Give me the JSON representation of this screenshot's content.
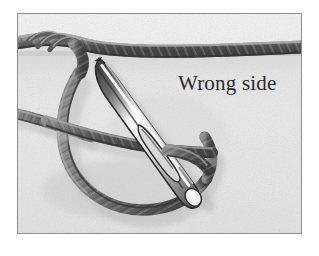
{
  "figure": {
    "kind": "instructional-illustration",
    "caption": "Wrong side",
    "frame": {
      "border_color": "#8e8e8e",
      "page_background": "#ffffff"
    },
    "palette": {
      "fabric_upper": "#f1f1f1",
      "fabric_lower": "#e6e6e6",
      "fabric_shadow": "#d2d2d2",
      "cord_dark": "#454545",
      "cord_mid": "#6d6d6d",
      "cord_light": "#9a9a9a",
      "needle_dark": "#3a3a3a",
      "needle_body": "#cfcfcf",
      "needle_highlight": "#ffffff",
      "caption_color": "#2a2a2a"
    },
    "elements": [
      {
        "name": "horizontal-cord",
        "label": "yarn running across the top of the fabric"
      },
      {
        "name": "cord-loop",
        "label": "large loop of yarn hanging below"
      },
      {
        "name": "left-cord-tail",
        "label": "yarn tail entering from the left edge"
      },
      {
        "name": "sewing-needle",
        "label": "tapestry needle angled from upper-left to lower-right"
      },
      {
        "name": "needle-eye",
        "label": "elongated eye of the needle"
      },
      {
        "name": "fabric-fold-line",
        "label": "horizontal fold/seam shading across the fabric"
      }
    ]
  }
}
